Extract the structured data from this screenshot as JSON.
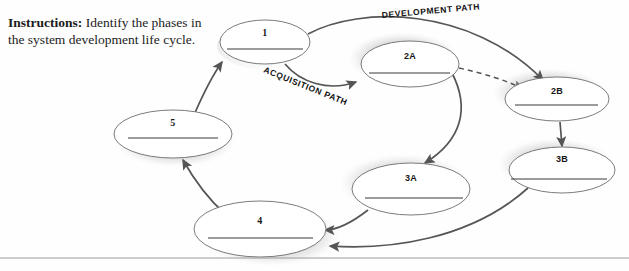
{
  "instructions": {
    "lead": "Instructions:",
    "text": " Identify the phases in the system development life cycle."
  },
  "diagram": {
    "nodes": [
      {
        "id": "n1",
        "label": "1",
        "cx": 265,
        "cy": 42,
        "rx": 45,
        "ry": 22
      },
      {
        "id": "n2a",
        "label": "2A",
        "cx": 410,
        "cy": 64,
        "rx": 49,
        "ry": 23
      },
      {
        "id": "n2b",
        "label": "2B",
        "cx": 557,
        "cy": 99,
        "rx": 52,
        "ry": 22
      },
      {
        "id": "n3b",
        "label": "3B",
        "cx": 562,
        "cy": 170,
        "rx": 53,
        "ry": 23
      },
      {
        "id": "n3a",
        "label": "3A",
        "cx": 411,
        "cy": 189,
        "rx": 59,
        "ry": 26
      },
      {
        "id": "n4",
        "label": "4",
        "cx": 260,
        "cy": 229,
        "rx": 66,
        "ry": 28
      },
      {
        "id": "n5",
        "label": "5",
        "cx": 173,
        "cy": 134,
        "rx": 59,
        "ry": 24
      }
    ],
    "path_labels": [
      {
        "id": "development-path",
        "text": "DEVELOPMENT PATH"
      },
      {
        "id": "acquisition-path",
        "text": "ACQUISITION PATH"
      }
    ],
    "connectors": [
      {
        "id": "n5-to-n1",
        "from": "5",
        "to": "1",
        "style": "solid"
      },
      {
        "id": "n1-to-n2a",
        "from": "1",
        "to": "2A",
        "style": "solid",
        "label": "ACQUISITION PATH"
      },
      {
        "id": "n1-to-n2b",
        "from": "1",
        "to": "2B",
        "style": "solid",
        "label": "DEVELOPMENT PATH"
      },
      {
        "id": "n2a-to-n2b",
        "from": "2A",
        "to": "2B",
        "style": "dashed"
      },
      {
        "id": "n2a-to-n3a",
        "from": "2A",
        "to": "3A",
        "style": "solid"
      },
      {
        "id": "n2b-to-n3b",
        "from": "2B",
        "to": "3B",
        "style": "solid"
      },
      {
        "id": "n3a-to-n4",
        "from": "3A",
        "to": "4",
        "style": "solid"
      },
      {
        "id": "n3b-to-n4",
        "from": "3B",
        "to": "4",
        "style": "solid"
      },
      {
        "id": "n4-to-n5",
        "from": "4",
        "to": "5",
        "style": "solid"
      }
    ]
  },
  "colors": {
    "stroke": "#555557",
    "ellipse_outline": "#6c6c6c",
    "answer_rule": "#3a3a3a",
    "text": "#1b1b1b",
    "page_background": "#fefefe"
  }
}
